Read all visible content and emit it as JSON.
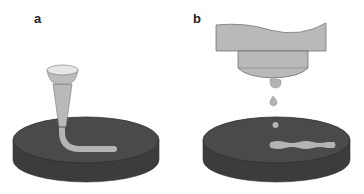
{
  "figure": {
    "panels": [
      {
        "label": "a",
        "description": "Extrusion-based printing: nozzle depositing a continuous filament onto a build platform",
        "elements": [
          "nozzle",
          "extruded-filament",
          "build-platform"
        ]
      },
      {
        "label": "b",
        "description": "Inkjet/droplet-based printing: print head ejecting droplets onto a build platform forming a line",
        "elements": [
          "print-head",
          "droplets",
          "deposited-line",
          "build-platform"
        ]
      }
    ],
    "colors": {
      "platform_top": "#4a4a4a",
      "platform_side": "#3c3c3c",
      "material": "#b4b4b4",
      "nozzle": "#b9b9b9",
      "nozzle_cup_inner": "#e6e6e6",
      "outline": "#555555"
    }
  }
}
